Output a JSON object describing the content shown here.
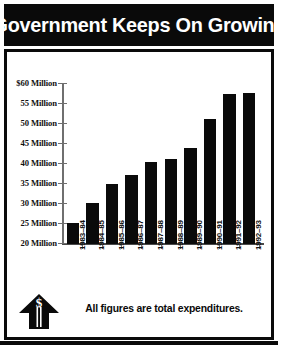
{
  "title": "Government Keeps On Growing",
  "caption": "All figures are total expenditures.",
  "icon": {
    "dollar_arrow": "dollar-up-arrow-icon",
    "dollar_glyph": "$"
  },
  "chart_data": {
    "type": "bar",
    "title": "Government Keeps On Growing",
    "xlabel": "",
    "ylabel": "",
    "ylim": [
      20,
      60
    ],
    "ytick_step": 5,
    "grid": false,
    "legend": null,
    "units": "Million",
    "note": "All figures are total expenditures.",
    "categories": [
      "1983-84",
      "1984-85",
      "1985-86",
      "1986-87",
      "1987-88",
      "1988-89",
      "1989-90",
      "1990-91",
      "1991-92",
      "1992-93"
    ],
    "values": [
      25.2,
      30.3,
      34.9,
      37.2,
      40.6,
      41.2,
      44.1,
      51.2,
      57.5,
      57.7
    ],
    "ytick_labels": [
      "$60 Million",
      "55 Million",
      "50 Million",
      "45 Million",
      "40 Million",
      "35 Million",
      "30 Million",
      "25 Million",
      "20 Million"
    ],
    "ytick_values": [
      60,
      55,
      50,
      45,
      40,
      35,
      30,
      25,
      20
    ],
    "bar_color": "#0a0a0a",
    "background_color": "#ffffff",
    "axis_color": "#6f6f6f"
  }
}
